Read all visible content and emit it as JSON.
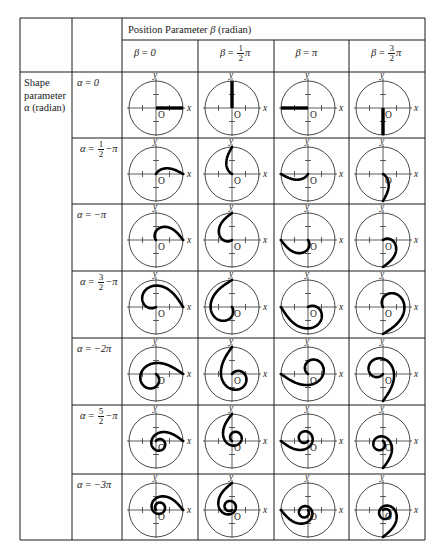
{
  "table": {
    "corner_cells": [
      "",
      ""
    ],
    "group_header": {
      "label_prefix": "Position Parameter ",
      "symbol": "β",
      "label_suffix": " (radian)"
    },
    "row_group_header": {
      "line1": "Shape",
      "line2": "parameter",
      "line3": "α (radian)"
    },
    "columns": [
      {
        "symbol": "β",
        "eq": " = ",
        "whole": "0",
        "num": "",
        "den": "",
        "pi": "",
        "value": 0
      },
      {
        "symbol": "β",
        "eq": " = ",
        "whole": "",
        "num": "1",
        "den": "2",
        "pi": "π",
        "value": 1.5707963
      },
      {
        "symbol": "β",
        "eq": " = ",
        "whole": "π",
        "num": "",
        "den": "",
        "pi": "",
        "value": 3.1415927
      },
      {
        "symbol": "β",
        "eq": " = ",
        "whole": "",
        "num": "3",
        "den": "2",
        "pi": "π",
        "value": 4.712389
      }
    ],
    "rows": [
      {
        "symbol": "α",
        "eq": " = ",
        "whole": "0",
        "num": "",
        "den": "",
        "tail": "",
        "value": 0
      },
      {
        "symbol": "α",
        "eq": " = ",
        "whole": "",
        "num": "1",
        "den": "2",
        "tail": "−π",
        "value": -1.5707963
      },
      {
        "symbol": "α",
        "eq": " = ",
        "whole": "−π",
        "num": "",
        "den": "",
        "tail": "",
        "value": -3.1415927
      },
      {
        "symbol": "α",
        "eq": " = ",
        "whole": "",
        "num": "3",
        "den": "2",
        "tail": "−π",
        "value": -4.712389
      },
      {
        "symbol": "α",
        "eq": " = ",
        "whole": "−2π",
        "num": "",
        "den": "",
        "tail": "",
        "value": -6.2831853
      },
      {
        "symbol": "α",
        "eq": " = ",
        "whole": "",
        "num": "5",
        "den": "2",
        "tail": "−π",
        "value": -7.8539816
      },
      {
        "symbol": "α",
        "eq": " = ",
        "whole": "−3π",
        "num": "",
        "den": "",
        "tail": "",
        "value": -9.424778
      }
    ],
    "plot_labels": {
      "x_axis": "x",
      "y_axis": "y",
      "origin": "O"
    }
  },
  "colors": {
    "line": "#1a1a1a",
    "curve": "#000000",
    "circle": "#333333",
    "background": "#ffffff"
  }
}
